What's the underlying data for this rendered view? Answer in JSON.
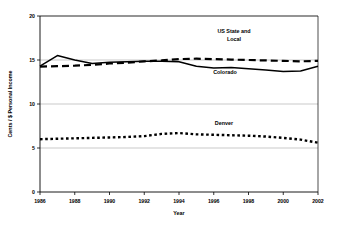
{
  "chart_data": {
    "type": "line",
    "title": "",
    "xlabel": "Year",
    "ylabel": "Cents / $ Personal Income",
    "xlim": [
      1986,
      2002
    ],
    "ylim": [
      0,
      20
    ],
    "xticks": [
      1986,
      1988,
      1990,
      1992,
      1994,
      1996,
      1998,
      2000,
      2002
    ],
    "yticks": [
      0,
      5,
      10,
      15,
      20
    ],
    "xtick_labels": [
      "1986",
      "1988",
      "1990",
      "1992",
      "1994",
      "1996",
      "1998",
      "2000",
      "2002"
    ],
    "ytick_labels": [
      "0",
      "5",
      "10",
      "15",
      "20"
    ],
    "grid": "horizontal",
    "legend_position": "inline-annotations",
    "x": [
      1986,
      1987,
      1988,
      1989,
      1990,
      1991,
      1992,
      1993,
      1994,
      1995,
      1996,
      1997,
      1998,
      1999,
      2000,
      2001,
      2002
    ],
    "series": [
      {
        "name": "US State and Local",
        "style": "dashed",
        "color": "#000000",
        "label_text": "US State and\nLocal",
        "label_line1": "US State and",
        "label_line2": "Local",
        "values": [
          14.25,
          14.3,
          14.35,
          14.45,
          14.6,
          14.7,
          14.85,
          14.95,
          15.1,
          15.15,
          15.1,
          15.05,
          15.0,
          14.95,
          14.9,
          14.85,
          14.9
        ]
      },
      {
        "name": "Colorado",
        "style": "solid",
        "color": "#000000",
        "label_text": "Colorado",
        "values": [
          14.3,
          15.5,
          15.0,
          14.6,
          14.75,
          14.8,
          14.85,
          14.85,
          14.8,
          14.3,
          14.1,
          14.15,
          14.0,
          13.85,
          13.7,
          13.75,
          14.3
        ]
      },
      {
        "name": "Denver",
        "style": "dotted",
        "color": "#000000",
        "label_text": "Denver",
        "values": [
          6.0,
          6.05,
          6.1,
          6.15,
          6.2,
          6.25,
          6.35,
          6.6,
          6.7,
          6.55,
          6.5,
          6.45,
          6.4,
          6.3,
          6.15,
          5.95,
          5.6
        ]
      }
    ]
  },
  "annotations": {
    "us_state_local_line1": "US State and",
    "us_state_local_line2": "Local",
    "colorado": "Colorado",
    "denver": "Denver"
  }
}
